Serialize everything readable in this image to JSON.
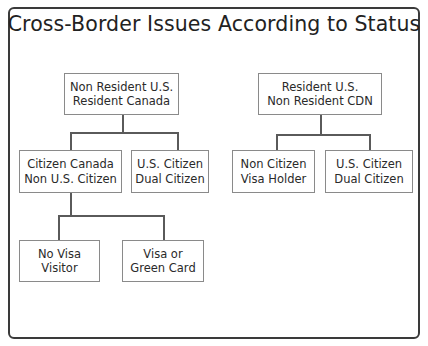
{
  "title": "Cross-Border Issues According to Status",
  "nodes": {
    "root_left": {
      "line1": "Non Resident U.S.",
      "line2": "Resident Canada"
    },
    "citizen_canada": {
      "line1": "Citizen Canada",
      "line2": "Non U.S. Citizen"
    },
    "us_citizen_left": {
      "line1": "U.S. Citizen",
      "line2": "Dual Citizen"
    },
    "no_visa": {
      "line1": "No Visa",
      "line2": "Visitor"
    },
    "visa_green": {
      "line1": "Visa or",
      "line2": "Green Card"
    },
    "root_right": {
      "line1": "Resident U.S.",
      "line2": "Non Resident CDN"
    },
    "non_citizen": {
      "line1": "Non Citizen",
      "line2": "Visa Holder"
    },
    "us_citizen_right": {
      "line1": "U.S. Citizen",
      "line2": "Dual Citizen"
    }
  }
}
